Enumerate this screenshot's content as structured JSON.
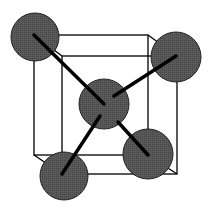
{
  "diagram": {
    "type": "body-centered-cubic-unit-cell",
    "colors": {
      "sphere": "#555555",
      "edge": "#000000",
      "bond": "#000000",
      "background": "#ffffff"
    },
    "cube": {
      "front": {
        "x1": 34,
        "y1": 35,
        "x2": 148,
        "y2": 155
      },
      "back": {
        "x1": 62,
        "y1": 56,
        "x2": 177,
        "y2": 174
      }
    },
    "spheres": [
      {
        "name": "corner-top-left",
        "cx": 35,
        "cy": 37,
        "r": 24
      },
      {
        "name": "corner-top-right",
        "cx": 176,
        "cy": 57,
        "r": 25
      },
      {
        "name": "center",
        "cx": 104,
        "cy": 104,
        "r": 25
      },
      {
        "name": "corner-bottom-left",
        "cx": 64,
        "cy": 176,
        "r": 24
      },
      {
        "name": "corner-bottom-right",
        "cx": 148,
        "cy": 154,
        "r": 25
      }
    ],
    "bonds": [
      {
        "from": [
          34,
          35
        ],
        "to": [
          104,
          104
        ]
      },
      {
        "from": [
          176,
          56
        ],
        "to": [
          114,
          96
        ]
      },
      {
        "from": [
          62,
          174
        ],
        "to": [
          100,
          116
        ]
      },
      {
        "from": [
          148,
          155
        ],
        "to": [
          118,
          122
        ]
      }
    ]
  }
}
